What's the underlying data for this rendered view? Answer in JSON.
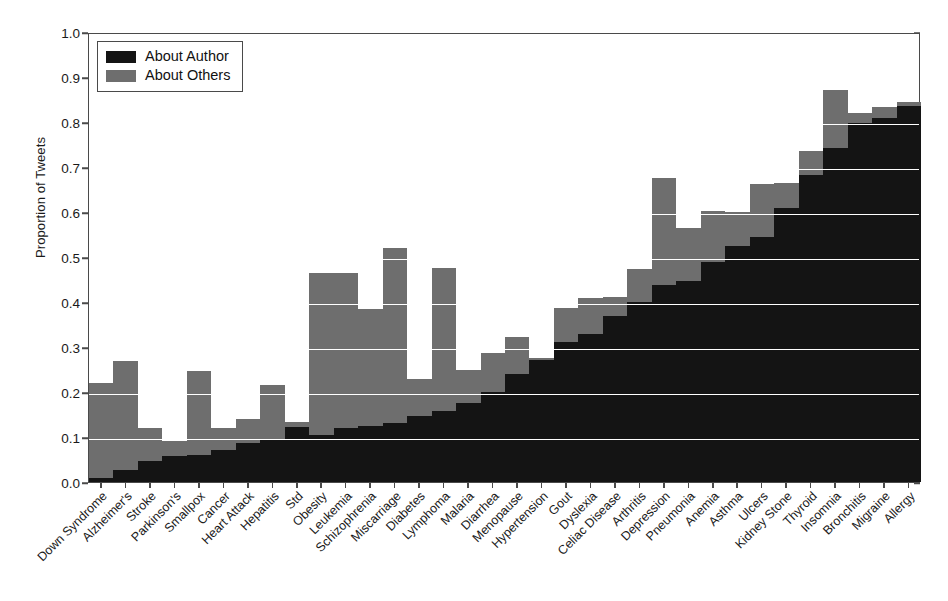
{
  "chart_data": {
    "type": "bar",
    "subtype": "stacked-vertical",
    "title": "",
    "xlabel": "",
    "ylabel": "Proportion of Tweets",
    "ylim": [
      0.0,
      1.0
    ],
    "ytick_labels": [
      "0.0",
      "0.1",
      "0.2",
      "0.3",
      "0.4",
      "0.5",
      "0.6",
      "0.7",
      "0.8",
      "0.9",
      "1.0"
    ],
    "ytick_values": [
      0.0,
      0.1,
      0.2,
      0.3,
      0.4,
      0.5,
      0.6,
      0.7,
      0.8,
      0.9,
      1.0
    ],
    "grid": "horizontal-white-on-bars",
    "legend_position": "upper-left-inside",
    "categories": [
      "Down Syndrome",
      "Alzheimer's",
      "Stroke",
      "Parkinson's",
      "Smallpox",
      "Cancer",
      "Heart Attack",
      "Hepatitis",
      "Std",
      "Obesity",
      "Leukemia",
      "Schizophrenia",
      "Miscarriage",
      "Diabetes",
      "Lymphoma",
      "Malaria",
      "Diarrhea",
      "Menopause",
      "Hypertension",
      "Gout",
      "Dyslexia",
      "Celiac Disease",
      "Arthritis",
      "Depression",
      "Pneumonia",
      "Anemia",
      "Asthma",
      "Ulcers",
      "Kidney Stone",
      "Thyroid",
      "Insomnia",
      "Bronchitis",
      "Migraine",
      "Allergy"
    ],
    "series": [
      {
        "name": "About Author",
        "color": "#141414",
        "values": [
          0.01,
          0.027,
          0.046,
          0.058,
          0.06,
          0.072,
          0.086,
          0.093,
          0.122,
          0.105,
          0.12,
          0.124,
          0.131,
          0.147,
          0.158,
          0.175,
          0.201,
          0.239,
          0.272,
          0.312,
          0.33,
          0.37,
          0.4,
          0.437,
          0.447,
          0.49,
          0.524,
          0.545,
          0.61,
          0.683,
          0.742,
          0.797,
          0.808,
          0.836
        ]
      },
      {
        "name": "About Others",
        "color": "#6e6e6e",
        "values": [
          0.21,
          0.243,
          0.074,
          0.033,
          0.186,
          0.049,
          0.055,
          0.123,
          0.011,
          0.36,
          0.345,
          0.261,
          0.389,
          0.081,
          0.318,
          0.075,
          0.086,
          0.084,
          0.003,
          0.075,
          0.08,
          0.042,
          0.074,
          0.238,
          0.117,
          0.113,
          0.076,
          0.117,
          0.054,
          0.052,
          0.13,
          0.023,
          0.025,
          0.008
        ]
      }
    ],
    "totals": [
      0.22,
      0.27,
      0.12,
      0.091,
      0.246,
      0.121,
      0.141,
      0.216,
      0.133,
      0.465,
      0.465,
      0.385,
      0.52,
      0.228,
      0.476,
      0.25,
      0.287,
      0.323,
      0.275,
      0.387,
      0.41,
      0.412,
      0.474,
      0.675,
      0.564,
      0.603,
      0.6,
      0.662,
      0.664,
      0.735,
      0.872,
      0.82,
      0.833,
      0.844
    ]
  },
  "legend": {
    "items": [
      {
        "label": "About Author",
        "color": "#141414"
      },
      {
        "label": "About Others",
        "color": "#6e6e6e"
      }
    ]
  },
  "axes": {
    "y_title": "Proportion of Tweets"
  }
}
